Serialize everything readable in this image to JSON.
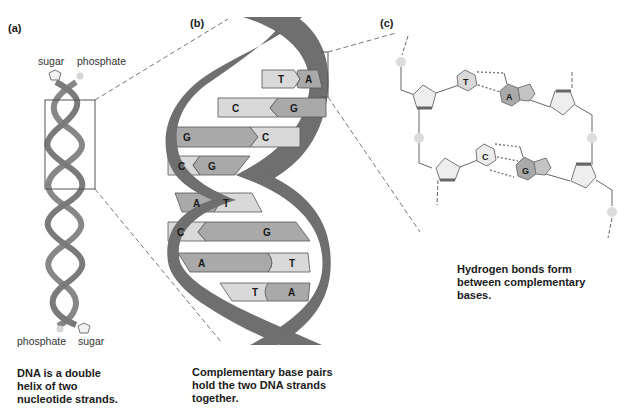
{
  "panels": {
    "a": {
      "label": "(a)",
      "top_labels": {
        "sugar": "sugar",
        "phosphate": "phosphate"
      },
      "bottom_labels": {
        "phosphate": "phosphate",
        "sugar": "sugar"
      },
      "caption": "DNA is a double\nhelix of two\nnucleotide strands."
    },
    "b": {
      "label": "(b)",
      "base_pairs": [
        {
          "left": "T",
          "right": "A"
        },
        {
          "left": "C",
          "right": "G"
        },
        {
          "left": "G",
          "right": "C"
        },
        {
          "left": "C",
          "right": "G"
        },
        {
          "left": "A",
          "right": "T"
        },
        {
          "left": "C",
          "right": "G"
        },
        {
          "left": "A",
          "right": "T"
        },
        {
          "left": "T",
          "right": "A"
        }
      ],
      "caption": "Complementary base pairs\nhold the two DNA strands\ntogether."
    },
    "c": {
      "label": "(c)",
      "pairs": [
        {
          "left": "T",
          "right": "A",
          "hydrogen_bonds": 2
        },
        {
          "left": "C",
          "right": "G",
          "hydrogen_bonds": 3
        }
      ],
      "caption": "Hydrogen bonds form\nbetween complementary\nbases."
    }
  },
  "colors": {
    "backbone": "#6f6f6f",
    "purine_fill": "#a9a9a9",
    "pyrimidine_fill": "#d9d9d9",
    "sugar_fill": "#eeeeee",
    "phosphate_fill": "#dcdcdc",
    "line": "#555555"
  }
}
